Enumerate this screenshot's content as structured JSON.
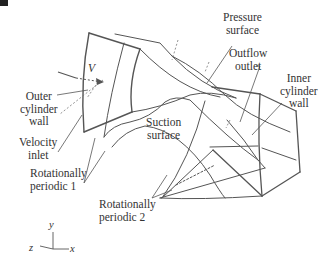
{
  "figure": {
    "labels": {
      "pressure_surface": [
        "Pressure",
        "surface"
      ],
      "outflow_outlet": [
        "Outflow",
        "outlet"
      ],
      "inner_cylinder_wall": [
        "Inner",
        "cylinder",
        "wall"
      ],
      "outer_cylinder_wall": [
        "Outer",
        "cylinder",
        "wall"
      ],
      "velocity_inlet": [
        "Velocity",
        "inlet"
      ],
      "suction_surface": [
        "Suction",
        "surface"
      ],
      "rotationally_periodic_1": [
        "Rotationally",
        "periodic 1"
      ],
      "rotationally_periodic_2": [
        "Rotationally",
        "periodic 2"
      ],
      "velocity_symbol": "V"
    },
    "axes": {
      "y": "y",
      "z": "z",
      "x": "x"
    }
  }
}
